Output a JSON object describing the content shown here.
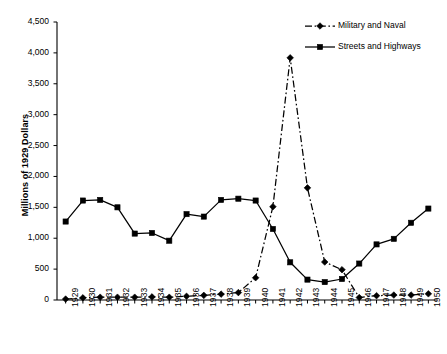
{
  "chart_data": {
    "type": "line",
    "title": "",
    "xlabel": "",
    "ylabel": "Millions of 1929 Dollars",
    "ylim": [
      0,
      4500
    ],
    "ytick_step": 500,
    "grid": false,
    "legend_position": "top-right",
    "x": [
      "1929",
      "1930",
      "1931",
      "1932",
      "1933",
      "1934",
      "1935",
      "1936",
      "1937",
      "1938",
      "1939",
      "1940",
      "1941",
      "1942",
      "1943",
      "1944",
      "1945",
      "1946",
      "1947",
      "1948",
      "1949",
      "1950"
    ],
    "ytick_labels": [
      "0",
      "500",
      "1,000",
      "1,500",
      "2,000",
      "2,500",
      "3,000",
      "3,500",
      "4,000",
      "4,500"
    ],
    "ytick_values": [
      0,
      500,
      1000,
      1500,
      2000,
      2500,
      3000,
      3500,
      4000,
      4500
    ],
    "series": [
      {
        "name": "Military and Naval",
        "marker": "diamond",
        "line_style": "dash-dot",
        "color": "#000000",
        "values": [
          15,
          35,
          45,
          45,
          45,
          50,
          45,
          60,
          75,
          95,
          120,
          360,
          1510,
          3920,
          1815,
          615,
          490,
          40,
          70,
          80,
          80,
          100
        ]
      },
      {
        "name": "Streets and Highways",
        "marker": "square",
        "line_style": "solid",
        "color": "#000000",
        "values": [
          1270,
          1610,
          1620,
          1500,
          1075,
          1085,
          960,
          1390,
          1350,
          1620,
          1640,
          1610,
          1150,
          610,
          330,
          290,
          340,
          590,
          900,
          990,
          1250,
          1480
        ]
      }
    ]
  },
  "legend": {
    "items": [
      {
        "label": "Military and Naval"
      },
      {
        "label": "Streets and Highways"
      }
    ]
  },
  "axes": {
    "y_title": "Millions of 1929 Dollars"
  }
}
